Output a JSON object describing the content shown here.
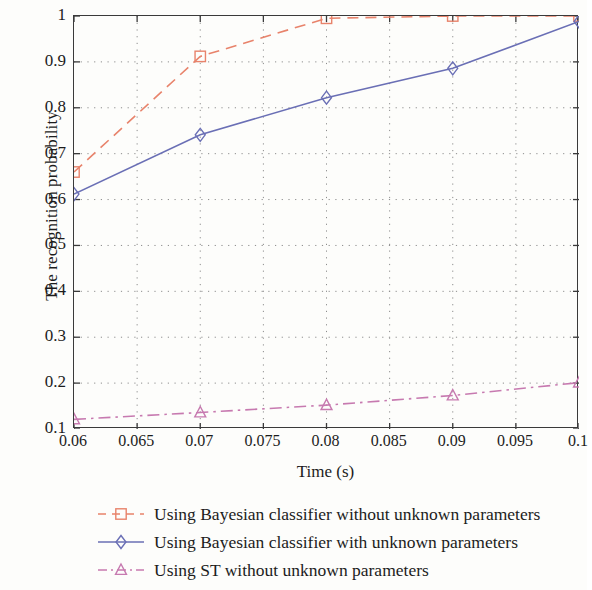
{
  "chart_data": {
    "type": "line",
    "title": "",
    "xlabel": "Time (s)",
    "ylabel": "The recognition probability",
    "xlim": [
      0.06,
      0.1
    ],
    "ylim": [
      0.1,
      1.0
    ],
    "grid": true,
    "legend_position": "below",
    "xticks": [
      "0.06",
      "0.065",
      "0.07",
      "0.075",
      "0.08",
      "0.085",
      "0.09",
      "0.095",
      "0.1"
    ],
    "xtick_values": [
      0.06,
      0.065,
      0.07,
      0.075,
      0.08,
      0.085,
      0.09,
      0.095,
      0.1
    ],
    "yticks": [
      "0.1",
      "0.2",
      "0.3",
      "0.4",
      "0.5",
      "0.6",
      "0.7",
      "0.8",
      "0.9",
      "1"
    ],
    "ytick_values": [
      0.1,
      0.2,
      0.3,
      0.4,
      0.5,
      0.6,
      0.7,
      0.8,
      0.9,
      1.0
    ],
    "x": [
      0.06,
      0.07,
      0.08,
      0.09,
      0.1
    ],
    "series": [
      {
        "name": "Using Bayesian classifier without unknown parameters",
        "values": [
          0.66,
          0.912,
          0.995,
          1.0,
          1.0
        ],
        "color": "#e8836b",
        "marker": "square",
        "linestyle": "dashed"
      },
      {
        "name": "Using Bayesian classifier with unknown parameters",
        "values": [
          0.612,
          0.741,
          0.822,
          0.886,
          0.988
        ],
        "color": "#6a6fb5",
        "marker": "diamond",
        "linestyle": "solid"
      },
      {
        "name": "Using ST without unknown parameters",
        "values": [
          0.121,
          0.136,
          0.152,
          0.173,
          0.201
        ],
        "color": "#c77ab0",
        "marker": "triangle",
        "linestyle": "dashdot"
      }
    ]
  },
  "axes": {
    "frame_color": "#3a3a3a",
    "grid_color": "#8d8d8d"
  }
}
